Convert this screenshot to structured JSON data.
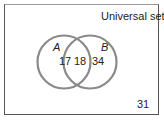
{
  "diagram": {
    "type": "venn",
    "universal_label": "Universal set",
    "sets": [
      {
        "name": "A",
        "only": "17"
      },
      {
        "name": "B",
        "only": "34"
      }
    ],
    "intersection": "18",
    "outside": "31",
    "circle_color": "#8a8a8a"
  }
}
